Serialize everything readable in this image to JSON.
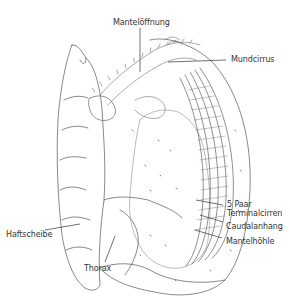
{
  "diagram": {
    "type": "anatomical line drawing",
    "labels": {
      "mantle_opening": "Mantelöffnung",
      "mouth_cirrus": "Mundcirrus",
      "terminal_cirri_line1": "5 Paar",
      "terminal_cirri_line2": "Terminalcirren",
      "caudal_appendage": "Caudalanhang",
      "mantle_cavity": "Mantelhöhle",
      "attachment_disc": "Haftscheibe",
      "thorax": "Thorax"
    },
    "colors": {
      "line": "#444444",
      "text": "#333333",
      "background": "#ffffff"
    }
  }
}
